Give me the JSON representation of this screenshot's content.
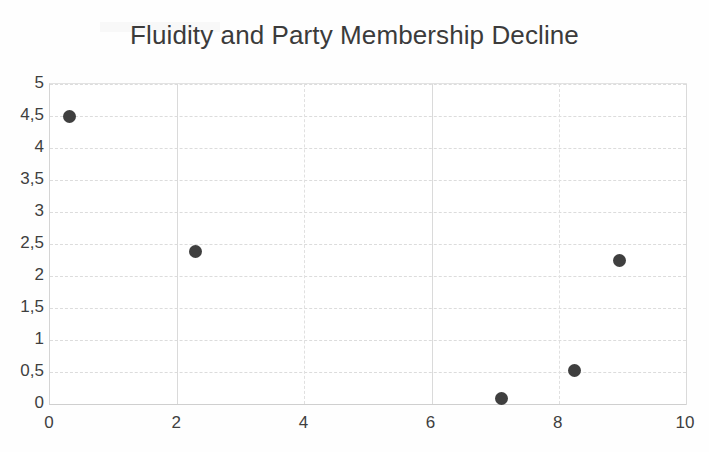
{
  "chart_data": {
    "type": "scatter",
    "title": "Fluidity and Party Membership Decline",
    "xlabel": "",
    "ylabel": "",
    "xlim": [
      0,
      10
    ],
    "ylim": [
      0,
      5
    ],
    "grid": true,
    "legend": "none",
    "marker_color": "#3f3f3f",
    "decimal_separator": ",",
    "x_ticks": [
      "0",
      "2",
      "4",
      "6",
      "8",
      "10"
    ],
    "x_tick_values": [
      0,
      2,
      4,
      6,
      8,
      10
    ],
    "y_ticks": [
      "0",
      "0,5",
      "1",
      "1,5",
      "2",
      "2,5",
      "3",
      "3,5",
      "4",
      "4,5",
      "5"
    ],
    "y_tick_values": [
      0,
      0.5,
      1,
      1.5,
      2,
      2.5,
      3,
      3.5,
      4,
      4.5,
      5
    ],
    "series": [
      {
        "name": "Countries",
        "points": [
          {
            "x": 0.3,
            "y": 4.5
          },
          {
            "x": 2.28,
            "y": 2.38
          },
          {
            "x": 7.1,
            "y": 0.08
          },
          {
            "x": 8.24,
            "y": 0.53
          },
          {
            "x": 8.95,
            "y": 2.24
          }
        ]
      }
    ]
  }
}
